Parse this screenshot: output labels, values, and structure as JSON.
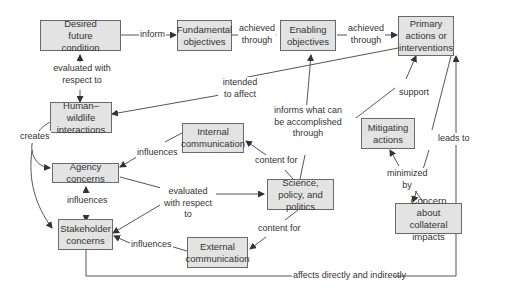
{
  "nodes": {
    "desired_future": "Desired future condition",
    "fundamental": "Fundamental objectives",
    "enabling": "Enabling objectives",
    "primary": "Primary actions or interventions",
    "human_wildlife": "Human–wildlife interactions",
    "internal_comm": "Internal communication",
    "agency": "Agency concerns",
    "science": "Science, policy, and politics",
    "stakeholder": "Stakeholder concerns",
    "external_comm": "External communication",
    "mitigating": "Mitigating actions",
    "collateral": "Concern about collateral impacts"
  },
  "edges": {
    "inform": "inform",
    "achieved1": "achieved through",
    "achieved2": "achieved through",
    "evaluated1": "evaluated with respect to",
    "intended": "intended to affect",
    "informs_what": "informs what can be accomplished through",
    "support": "support",
    "creates": "creates",
    "influences1": "influences",
    "content_for1": "content for",
    "leads_to": "leads to",
    "evaluated2": "evaluated with respect to",
    "influences2": "influences",
    "minimized": "minimized by",
    "content_for2": "content for",
    "influences3": "influences",
    "affects": "affects directly and indirectly"
  }
}
